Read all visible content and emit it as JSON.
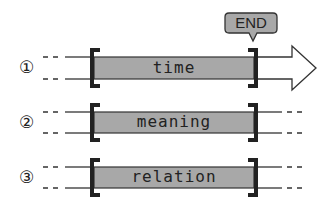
{
  "callout": {
    "label": "END"
  },
  "rows": [
    {
      "marker": "①",
      "label": "time",
      "extends": "arrow"
    },
    {
      "marker": "②",
      "label": "meaning",
      "extends": "dashed"
    },
    {
      "marker": "③",
      "label": "relation",
      "extends": "dashed"
    }
  ],
  "colors": {
    "bar_fill": "#a8a8a8",
    "bracket": "#222222",
    "callout_fill": "#a8a8a8",
    "line": "#333333"
  }
}
